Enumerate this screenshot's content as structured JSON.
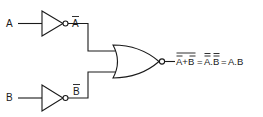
{
  "diagram": {
    "type": "logic-circuit",
    "inputs": [
      {
        "label": "A"
      },
      {
        "label": "B"
      }
    ],
    "inverters": [
      {
        "input": "A",
        "output_label": "A",
        "output_overbar": true
      },
      {
        "input": "B",
        "output_label": "B",
        "output_overbar": true
      }
    ],
    "gate": {
      "type": "NOR",
      "inputs": [
        "Ā",
        "B̄"
      ]
    },
    "output_expression": {
      "part1": "A+B",
      "part1_note": "double overbar: individual bars on A and B plus a bar over the whole sum",
      "eq1": "=",
      "part2": "A.B",
      "part2_note": "double overbars on each of A and B",
      "eq2": "=",
      "part3": "A.B"
    },
    "colors": {
      "ink": "#1a1a1a",
      "background": "#ffffff"
    }
  }
}
